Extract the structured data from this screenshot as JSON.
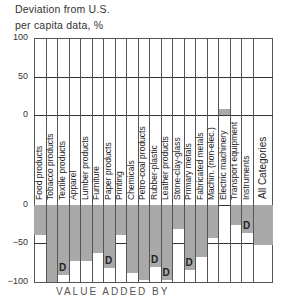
{
  "axis": {
    "title_line1": "Deviation from U.S.",
    "title_line2": "per capita data, %",
    "upper_ticks": [
      "100",
      "50",
      "0"
    ],
    "lower_ticks": [
      "0",
      "−50",
      "−100"
    ]
  },
  "caption": "VALUE ADDED BY",
  "chart_data": {
    "type": "bar",
    "title": "",
    "ylabel": "Deviation from U.S. per capita data, %",
    "xlabel": "",
    "ylim": [
      -100,
      100
    ],
    "grid": true,
    "categories": [
      "Food products",
      "Tobacco products",
      "Textile products",
      "Apparel",
      "Lumber products",
      "Furniture",
      "Paper products",
      "Printing",
      "Chemicals",
      "Petro-coal products",
      "Rubber-plastic",
      "Leather products",
      "Stone-clay-glass",
      "Primary metals",
      "Fabricated metals",
      "Machin. (non-elec.)",
      "Electric machinery",
      "Transport equipment",
      "Instruments",
      "All Categories"
    ],
    "values": [
      -39,
      -100,
      -91,
      -73,
      -73,
      -62,
      -82,
      -39,
      -88,
      -97,
      -80,
      -98,
      -31,
      -85,
      -67,
      -43,
      8,
      -26,
      -36,
      -52
    ],
    "annotations": [
      "D on Textile products",
      "D on Paper products",
      "D on Rubber-plastic",
      "D on Leather products",
      "D on Primary metals",
      "D on Instruments"
    ],
    "d_flags": [
      false,
      false,
      true,
      false,
      false,
      false,
      true,
      false,
      false,
      false,
      true,
      true,
      false,
      true,
      false,
      false,
      false,
      false,
      true,
      false
    ],
    "colors": {
      "bar": "#a9a9a9",
      "grid": "#555555"
    }
  }
}
